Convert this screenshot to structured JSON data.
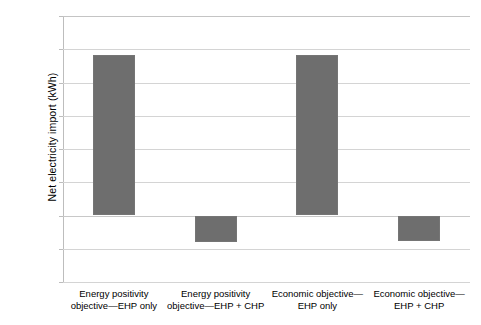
{
  "chart_data": {
    "type": "bar",
    "title": "",
    "xlabel": "",
    "ylabel": "Net electricity import (kWh)",
    "categories": [
      "Energy positivity objective—EHP only",
      "Energy positivity objective—EHP + CHP",
      "Economic objective—EHP only",
      "Economic objective—EHP + CHP"
    ],
    "category_lines": [
      [
        "Energy positivity",
        "objective—EHP only"
      ],
      [
        "Energy positivity",
        "objective—EHP + CHP"
      ],
      [
        "Economic objective—",
        "EHP only"
      ],
      [
        "Economic objective—",
        "EHP + CHP"
      ]
    ],
    "values": [
      483,
      -80,
      484,
      -78
    ],
    "ylim": [
      -200,
      600
    ],
    "ytick_values": [
      600,
      500,
      400,
      300,
      200,
      100,
      0,
      -100,
      -200
    ],
    "ytick_labels": [
      "600",
      "500",
      "400",
      "300",
      "200",
      "100",
      "0",
      "-100",
      "-200"
    ],
    "grid": true,
    "legend": "none",
    "bar_color": "#6e6e6e",
    "grid_color": "#d4d4d4",
    "axis_color": "#bdbdbd"
  }
}
